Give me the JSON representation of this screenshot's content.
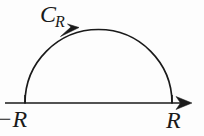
{
  "figure": {
    "background_color": "#fdfdfd",
    "stroke_color": "#1a1a1a",
    "labels": {
      "contour": {
        "base": "C",
        "subscript": "R",
        "full": "C_R"
      },
      "left_endpoint": {
        "minus": "−",
        "symbol": "R",
        "full": "−R"
      },
      "right_endpoint": {
        "symbol": "R",
        "full": "R"
      }
    },
    "geometry": {
      "real_axis": {
        "x_start": 5,
        "x_end": 192,
        "y": 103
      },
      "semicircle": {
        "center_x": 98.5,
        "center_y": 103,
        "radius": 73.5,
        "left_endpoint_x": 25,
        "right_endpoint_x": 172,
        "apex_y": 29.5
      },
      "arc_arrow": {
        "direction": "counterclockwise",
        "tip_x": 60,
        "tip_y": 35
      },
      "axis_arrow": {
        "direction": "right",
        "tip_x": 192,
        "tip_y": 103
      }
    }
  }
}
